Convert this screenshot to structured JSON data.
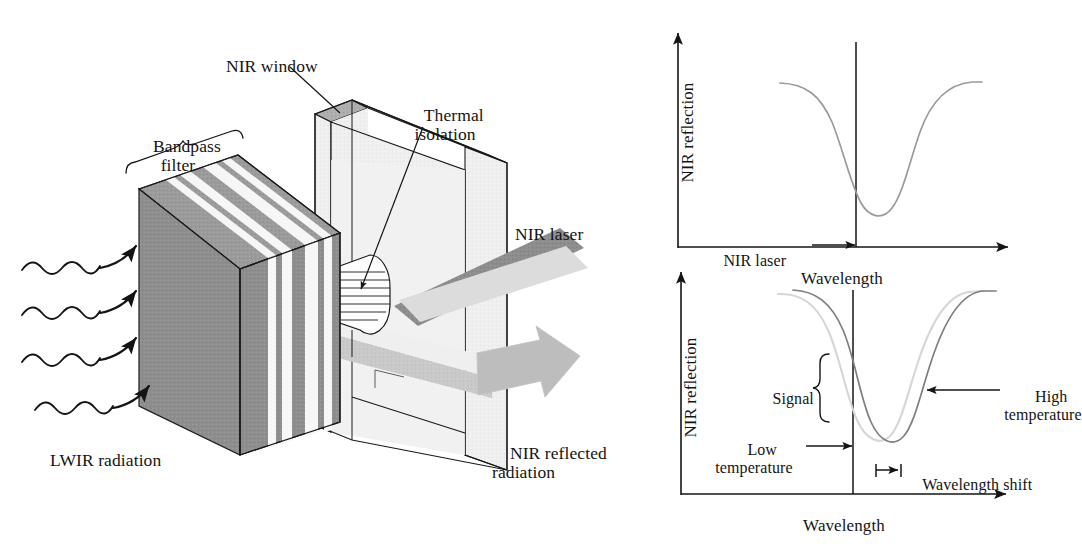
{
  "figure": {
    "kind": "technical-diagram-with-plots",
    "background": "#ffffff",
    "ink": "#141414"
  },
  "diagram": {
    "labels": {
      "bandpass_filter": "Bandpass\nfilter",
      "nir_window": "NIR window",
      "thermal_isolation": "Thermal\nisolation",
      "nir_laser": "NIR laser",
      "lwir_radiation": "LWIR radiation",
      "nir_reflected_radiation": "NIR reflected\nradiation"
    },
    "colors": {
      "filter_dark": "#8e8e8e",
      "filter_top_dark": "#9a9a9a",
      "filter_light": "#f2f2f2",
      "window_face": "#efefef",
      "window_edge_dark": "#b0b0b0",
      "window_top": "#a8a8a8",
      "beam_dark": "#8b8b8b",
      "beam_light": "#c9c9c9",
      "beam_pale": "#dcdcdc",
      "isolation_fill": "#f4f4f4",
      "outline": "#1a1a1a"
    },
    "lwir_wave_count": 4,
    "lwir_arrow_count": 4
  },
  "chart_data": [
    {
      "id": "top-chart",
      "type": "line",
      "title": "",
      "xlabel": "Wavelength",
      "ylabel": "NIR reflection",
      "grid": false,
      "legend": "none",
      "annotations": [
        {
          "text": "NIR laser",
          "kind": "arrow-label",
          "points_to": "laser-line"
        }
      ],
      "markers": [
        {
          "name": "laser-line",
          "type": "vertical-line",
          "x": 0.52
        }
      ],
      "series": [
        {
          "name": "NIR reflection spectrum",
          "color": "#9a9a9a",
          "style": "solid",
          "x": [
            0.28,
            0.34,
            0.4,
            0.45,
            0.49,
            0.52,
            0.55,
            0.58,
            0.62,
            0.66,
            0.7,
            0.74,
            0.79,
            0.85,
            0.92,
            1.0
          ],
          "y": [
            0.95,
            0.94,
            0.88,
            0.74,
            0.5,
            0.34,
            0.22,
            0.14,
            0.11,
            0.13,
            0.22,
            0.4,
            0.64,
            0.82,
            0.92,
            0.95
          ]
        }
      ],
      "xlim": [
        0,
        1
      ],
      "ylim": [
        0,
        1
      ]
    },
    {
      "id": "bottom-chart",
      "type": "line",
      "title": "",
      "xlabel": "Wavelength",
      "ylabel": "NIR reflection",
      "grid": false,
      "legend": "none",
      "annotations": [
        {
          "text": "Signal",
          "kind": "brace-label"
        },
        {
          "text": "Low\ntemperature",
          "kind": "arrow-label",
          "points_to": "laser-line"
        },
        {
          "text": "High\ntemperature",
          "kind": "arrow-label",
          "points_to": "high-temp-curve"
        },
        {
          "text": "Wavelength shift",
          "kind": "span-label",
          "points_to": "minima-offset"
        }
      ],
      "markers": [
        {
          "name": "laser-line",
          "type": "vertical-line",
          "x": 0.52
        }
      ],
      "series": [
        {
          "name": "Low temperature",
          "color": "#d4d4d4",
          "style": "solid-light",
          "x": [
            0.26,
            0.32,
            0.38,
            0.43,
            0.47,
            0.5,
            0.53,
            0.56,
            0.6,
            0.64,
            0.68,
            0.72,
            0.77,
            0.83,
            0.9,
            0.98
          ],
          "y": [
            0.96,
            0.93,
            0.85,
            0.7,
            0.48,
            0.33,
            0.21,
            0.13,
            0.09,
            0.11,
            0.21,
            0.41,
            0.67,
            0.86,
            0.95,
            0.97
          ]
        },
        {
          "name": "High temperature",
          "color": "#7b7b7b",
          "style": "solid",
          "x": [
            0.31,
            0.37,
            0.43,
            0.48,
            0.52,
            0.55,
            0.58,
            0.61,
            0.65,
            0.69,
            0.73,
            0.77,
            0.82,
            0.88,
            0.95,
            1.0
          ],
          "y": [
            0.97,
            0.93,
            0.85,
            0.7,
            0.48,
            0.33,
            0.21,
            0.13,
            0.09,
            0.11,
            0.21,
            0.41,
            0.67,
            0.86,
            0.95,
            0.97
          ]
        }
      ],
      "xlim": [
        0,
        1
      ],
      "ylim": [
        0,
        1
      ]
    }
  ],
  "charts": {
    "top": {
      "ylabel": "NIR reflection",
      "xlabel": "Wavelength",
      "laser_label": "NIR laser"
    },
    "bottom": {
      "ylabel": "NIR reflection",
      "xlabel": "Wavelength",
      "signal_label": "Signal",
      "low_temperature_label": "Low\ntemperature",
      "high_temperature_label": "High\ntemperature",
      "wavelength_shift_label": "Wavelength shift"
    }
  }
}
